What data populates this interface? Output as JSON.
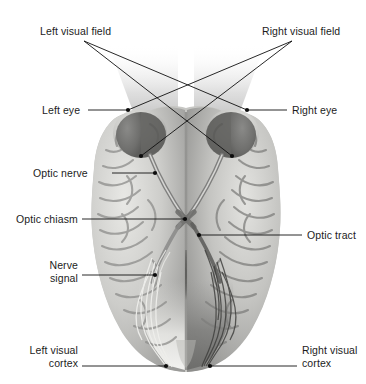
{
  "diagram": {
    "colors": {
      "background": "#ffffff",
      "label_text": "#1c1c1c",
      "leader_line": "#101010",
      "brain_light": "#d8d8d6",
      "brain_mid": "#b4b4b2",
      "brain_dark": "#8f8f8d",
      "eye_region": "#6e6e6e",
      "field_cone": "#bdbdbd",
      "nerve_pale": "#e9e9e6"
    }
  },
  "labels": {
    "left_visual_field": "Left visual field",
    "right_visual_field": "Right visual field",
    "left_eye": "Left eye",
    "right_eye": "Right eye",
    "optic_nerve": "Optic nerve",
    "optic_chiasm": "Optic chiasm",
    "optic_tract": "Optic tract",
    "nerve_signal_line1": "Nerve",
    "nerve_signal_line2": "signal",
    "left_visual_cortex_line1": "Left visual",
    "left_visual_cortex_line2": "cortex",
    "right_visual_cortex_line1": "Right visual",
    "right_visual_cortex_line2": "cortex"
  },
  "anchors": {
    "left_visual_field": {
      "x": 186,
      "y": 103
    },
    "right_visual_field": {
      "x": 186,
      "y": 103
    },
    "left_eye": {
      "x": 128,
      "y": 110
    },
    "right_eye": {
      "x": 247,
      "y": 110
    },
    "optic_nerve": {
      "x": 155,
      "y": 173
    },
    "optic_chiasm": {
      "x": 185,
      "y": 219
    },
    "optic_tract": {
      "x": 199,
      "y": 235
    },
    "nerve_signal": {
      "x": 155,
      "y": 275
    },
    "left_visual_cortex": {
      "x": 166,
      "y": 366
    },
    "right_visual_cortex": {
      "x": 210,
      "y": 366
    }
  }
}
